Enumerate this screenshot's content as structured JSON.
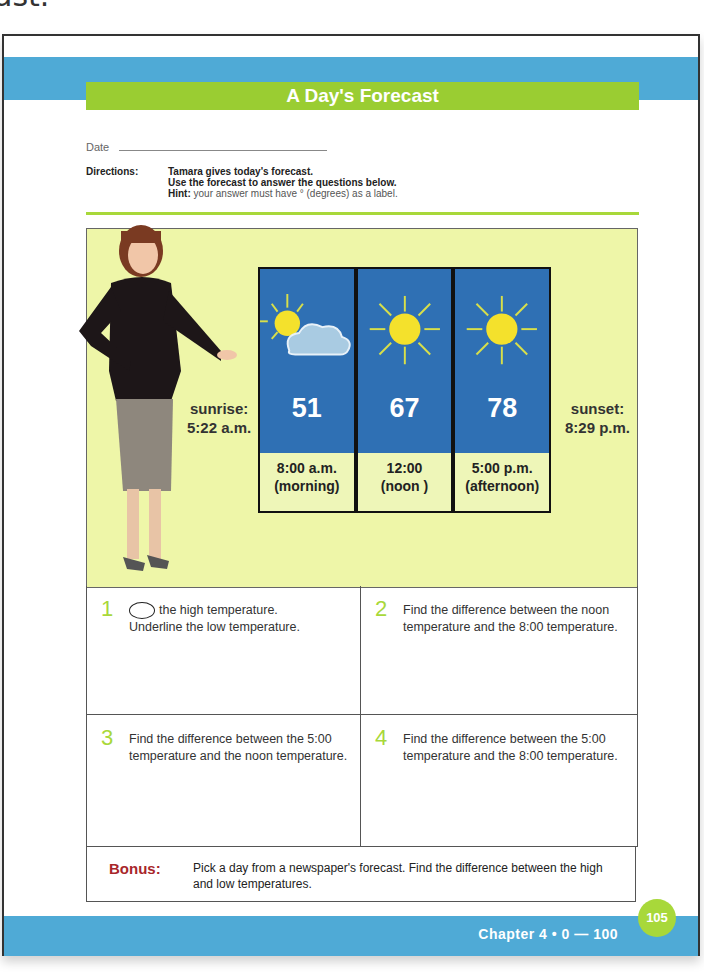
{
  "top_fragment": "ast.",
  "title": "A Day's Forecast",
  "date": {
    "label": "Date"
  },
  "directions": {
    "label": "Directions:",
    "line1": "Tamara gives today's forecast.",
    "line2": "Use the forecast to answer the questions below.",
    "hint_label": "Hint:",
    "hint_text": " your answer must have  ° (degrees) as a label."
  },
  "forecast": {
    "sunrise_label": "sunrise:",
    "sunrise_time": "5:22 a.m.",
    "sunset_label": "sunset:",
    "sunset_time": "8:29 p.m.",
    "columns": [
      {
        "icon": "partly-cloudy-icon",
        "temp": "51",
        "time": "8:00 a.m.",
        "period": "(morning)"
      },
      {
        "icon": "sun-icon",
        "temp": "67",
        "time": "12:00",
        "period": "(noon )"
      },
      {
        "icon": "sun-icon",
        "temp": "78",
        "time": "5:00 p.m.",
        "period": "(afternoon)"
      }
    ]
  },
  "questions": [
    {
      "num": "1",
      "text_after_oval": "the high temperature.",
      "text2": "Underline the low temperature."
    },
    {
      "num": "2",
      "text": "Find the difference between the noon temperature and the 8:00 temperature."
    },
    {
      "num": "3",
      "text": "Find the difference between the 5:00 temperature and the noon temperature."
    },
    {
      "num": "4",
      "text": "Find the difference between the 5:00 temperature and the 8:00 temperature."
    }
  ],
  "bonus": {
    "label": "Bonus:",
    "text": "Pick a day from a newspaper's forecast. Find the difference between the high and low temperatures."
  },
  "footer": {
    "chapter": "Chapter 4  •   0 — 100",
    "page_number": "105"
  },
  "colors": {
    "blue_band": "#4faad6",
    "green_accent": "#9acd32",
    "board_sky": "#2f70b4",
    "bonus_red": "#a8262a"
  }
}
